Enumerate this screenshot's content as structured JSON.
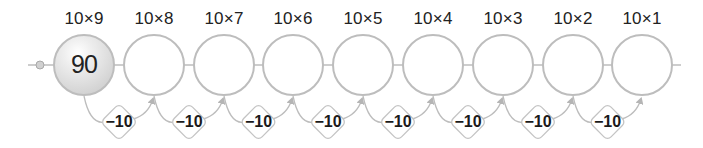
{
  "diagram": {
    "type": "number-line-sequence",
    "steps": [
      {
        "label": "10×9",
        "value": "90",
        "filled": true
      },
      {
        "label": "10×8",
        "value": "",
        "filled": false
      },
      {
        "label": "10×7",
        "value": "",
        "filled": false
      },
      {
        "label": "10×6",
        "value": "",
        "filled": false
      },
      {
        "label": "10×5",
        "value": "",
        "filled": false
      },
      {
        "label": "10×4",
        "value": "",
        "filled": false
      },
      {
        "label": "10×3",
        "value": "",
        "filled": false
      },
      {
        "label": "10×2",
        "value": "",
        "filled": false
      },
      {
        "label": "10×1",
        "value": "",
        "filled": false
      }
    ],
    "transitions": [
      "−10",
      "−10",
      "−10",
      "−10",
      "−10",
      "−10",
      "−10",
      "−10"
    ],
    "colors": {
      "line": "#bdbdbd",
      "circle_stroke": "#bdbdbd",
      "filled_circle": "#e6e6e6",
      "text": "#222222"
    }
  }
}
